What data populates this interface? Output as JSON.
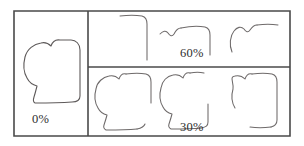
{
  "figure": {
    "kind": "occluded-contour-panels",
    "background_color": "#ffffff",
    "frame_color": "#4a4a4a",
    "contour_color": "#6e6a6a",
    "width": 304,
    "height": 146
  },
  "panels": [
    {
      "id": "panel-0",
      "label": "0%",
      "occlusion_percent": 0,
      "shape_count": 1,
      "description": "complete closed blob outline"
    },
    {
      "id": "panel-60",
      "label": "60%",
      "occlusion_percent": 60,
      "shape_count": 3,
      "description": "three heavily fragmented contours"
    },
    {
      "id": "panel-30",
      "label": "30%",
      "occlusion_percent": 30,
      "shape_count": 3,
      "description": "three partially fragmented contours"
    }
  ],
  "frame": {
    "outer": "M 14 11 L 290 11 L 290 136 L 14 136 Z",
    "vertical_divider": "M 88 11 L 88 136",
    "horizontal_divider": "M 88 67 L 290 67"
  },
  "contours": {
    "full_0": "M 60 40 C 54 39 52 43 51 46 C 49 44 45 42 41 43 C 34 44 27 49 25 57 C 23 65 24 73 27 78 C 29 82 33 85 37 86 C 36 90 35 94 34 97 C 33 100 33 102 35 103 C 42 103 58 103 72 102 C 78 102 80 100 80 96 C 80 82 80 60 80 50 C 80 44 76 40 71 40 C 67 40 63 40 60 40",
    "frag_60_a": [
      "M 120 16 C 128 15 136 15 142 16 C 146 17 147 20 147 24 C 147 36 147 52 147 60"
    ],
    "frag_60_b": [
      "M 160 34 C 163 31 166 30 168 33 C 170 36 172 37 174 34 C 176 30 178 28 181 28",
      "M 181 28 C 190 26 200 26 205 27 C 209 28 210 31 210 35 C 210 43 210 50 210 55"
    ],
    "frag_60_c": [
      "M 232 52 C 229 45 230 36 234 31 C 237 27 241 26 244 29 C 246 32 248 33 250 30 C 252 27 254 25 257 25",
      "M 257 25 C 264 24 272 24 278 25"
    ],
    "frag_30_a": [
      "M 126 74 C 122 73 120 76 119 79 C 117 77 113 75 109 76 C 103 77 97 82 96 89 C 94 96 95 103 98 108 C 100 112 103 114 107 115 C 106 119 105 122 104 125 C 103 128 104 129 106 130 C 113 130 126 130 137 129",
      "M 137 129 C 142 128 144 127 145 124",
      "M 126 74 C 133 73 141 73 146 74 C 150 75 151 78 151 82 C 151 90 151 98 151 103"
    ],
    "frag_30_b": [
      "M 190 73 C 186 72 184 75 183 78 C 181 76 177 74 173 75 C 167 76 162 81 161 88 C 159 95 160 102 163 107 C 165 111 168 113 172 114 C 171 118 170 121 169 124 C 168 127 169 128 171 129 C 178 129 191 129 201 128",
      "M 201 128 C 206 127 208 126 208 122 L 208 104",
      "M 190 73 C 195 72 200 72 204 73"
    ],
    "frag_30_c": [
      "M 252 74 C 248 73 246 76 245 79 C 243 77 239 75 235 76 C 229 77 234 82 233 89 C 231 96 232 103 235 108",
      "M 252 74 C 259 73 267 73 272 74 C 276 75 277 78 277 82 C 277 96 277 112 277 120 C 277 124 275 126 271 127",
      "M 271 127 C 264 128 256 128 250 127"
    ]
  }
}
